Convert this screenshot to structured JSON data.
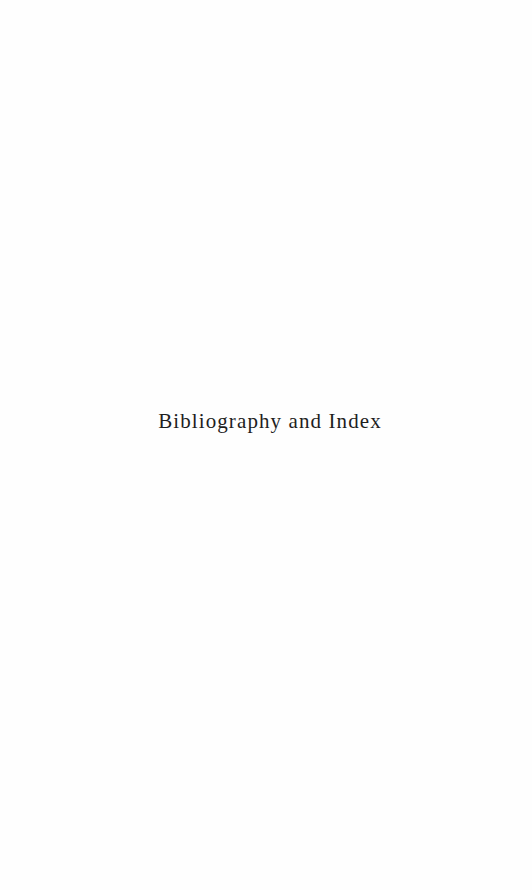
{
  "page": {
    "background": "#fefefe",
    "text_color": "#1e1e1e",
    "half_title": "Bibliography and Index"
  }
}
